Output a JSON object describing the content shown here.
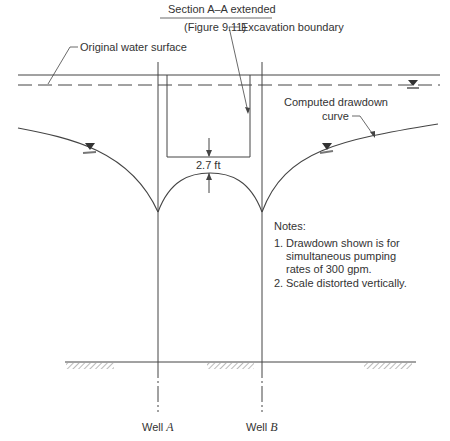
{
  "title": {
    "main": "Section A–A extended",
    "sub": "(Figure 9.11)"
  },
  "labels": {
    "original_water_surface": "Original water surface",
    "excavation_boundary": "Excavation boundary",
    "computed_drawdown_line1": "Computed drawdown",
    "computed_drawdown_line2": "curve",
    "clearance": "2.7 ft"
  },
  "notes": {
    "heading": "Notes:",
    "items": [
      {
        "num": "1.",
        "lines": [
          "Drawdown shown is for",
          "simultaneous pumping",
          "rates of 300 gpm."
        ]
      },
      {
        "num": "2.",
        "lines": [
          "Scale distorted vertically."
        ]
      }
    ]
  },
  "wells": [
    {
      "prefix": "Well ",
      "letter": "A"
    },
    {
      "prefix": "Well ",
      "letter": "B"
    }
  ],
  "colors": {
    "line": "#444444",
    "text": "#333333",
    "hatch": "#777777",
    "background": "#ffffff"
  }
}
